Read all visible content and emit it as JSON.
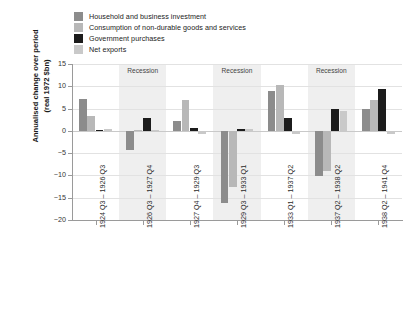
{
  "chart_data": {
    "type": "bar",
    "title": "",
    "subtitle": "",
    "xlabel": "",
    "ylabel": "Annualised change over period (real 1972 $bn)",
    "ylabel_line1": "Annualised change over period",
    "ylabel_line2": "(real 1972 $bn)",
    "ylim": [
      -20,
      15
    ],
    "yticks": [
      15,
      10,
      5,
      0,
      -5,
      -10,
      -15,
      -20
    ],
    "ytick_labels": [
      "15",
      "10",
      "5",
      "0",
      "−5",
      "−10",
      "−15",
      "−20"
    ],
    "grid": true,
    "legend_position": "top-left",
    "categories": [
      "1924 Q3 – 1926 Q3",
      "1926 Q3 – 1927 Q4",
      "1927 Q4 – 1929 Q3",
      "1929 Q3 – 1933 Q1",
      "1933 Q1 – 1937 Q2",
      "1937 Q2 – 1938 Q2",
      "1938 Q2 – 1941 Q4"
    ],
    "series": [
      {
        "name": "Household and business investment",
        "color": "#8c8c8c",
        "values": [
          7.2,
          -4.2,
          2.1,
          -16.2,
          9.0,
          -10.2,
          5.0
        ]
      },
      {
        "name": "Consumption of non-durable goods and services",
        "color": "#b8b8b8",
        "values": [
          3.3,
          0.3,
          7.0,
          -12.6,
          10.2,
          -9.0,
          7.0
        ]
      },
      {
        "name": "Government purchases",
        "color": "#1c1c1c",
        "values": [
          0.3,
          2.9,
          0.6,
          0.4,
          2.9,
          5.0,
          9.4
        ]
      },
      {
        "name": "Net exports",
        "color": "#c9c9c9",
        "values": [
          0.4,
          0.2,
          -0.7,
          0.5,
          -0.6,
          4.5,
          -0.6
        ]
      }
    ],
    "annotations": [
      {
        "label": "Recession",
        "category_index": 1
      },
      {
        "label": "Recession",
        "category_index": 3
      },
      {
        "label": "Recession",
        "category_index": 5
      }
    ],
    "recession_bands": [
      1,
      3,
      5
    ],
    "recession_band_color": "#efefef"
  }
}
